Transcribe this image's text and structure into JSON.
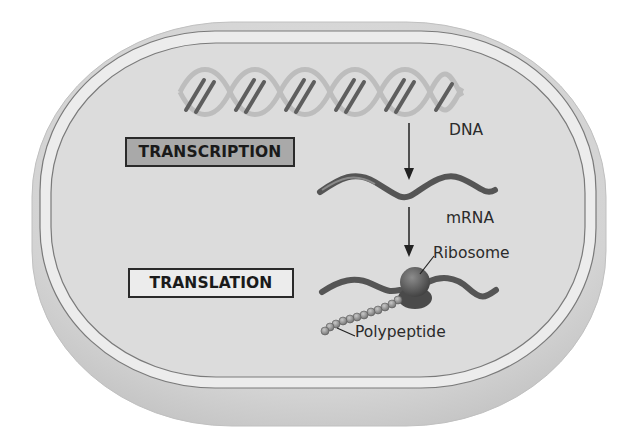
{
  "diagram": {
    "type": "flow",
    "process_labels": {
      "transcription": "TRANSCRIPTION",
      "translation": "TRANSLATION"
    },
    "molecule_labels": {
      "dna": "DNA",
      "mrna": "mRNA",
      "ribosome": "Ribosome",
      "polypeptide": "Polypeptide"
    },
    "flow": [
      {
        "from": "DNA",
        "to": "mRNA",
        "process": "TRANSCRIPTION"
      },
      {
        "from": "mRNA",
        "to": "Polypeptide",
        "process": "TRANSLATION",
        "via": "Ribosome"
      }
    ],
    "colors": {
      "cell_body": "#d4d4d4",
      "cytoplasm": "#dcdcdc",
      "membrane_gap": "#ececec",
      "membrane_line": "#7a7a7a",
      "dna_dark": "#5e5e5e",
      "dna_light": "#bdbdbd",
      "mrna": "#555555",
      "ribosome": "#5a5a5a",
      "polypeptide_bead": "#8a8a8a",
      "transcription_box": "#a9a9a9",
      "translation_box": "#ececec",
      "text": "#2b2b2b"
    }
  }
}
